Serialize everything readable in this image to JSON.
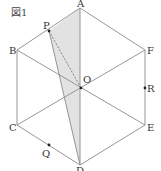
{
  "figure": {
    "title": "図1",
    "colors": {
      "line": "#8a8a8a",
      "shade": "#e2e2e2",
      "point": "#222222",
      "label": "#333333"
    },
    "vertices": {
      "A": {
        "label": "A",
        "x": 80,
        "y": 8
      },
      "B": {
        "label": "B",
        "x": 17,
        "y": 50
      },
      "C": {
        "label": "C",
        "x": 17,
        "y": 125
      },
      "D": {
        "label": "D",
        "x": 80,
        "y": 165
      },
      "E": {
        "label": "E",
        "x": 145,
        "y": 125
      },
      "F": {
        "label": "F",
        "x": 145,
        "y": 50
      },
      "O": {
        "label": "O",
        "x": 81,
        "y": 88
      }
    },
    "points": {
      "P": {
        "label": "P",
        "x": 49,
        "y": 31
      },
      "Q": {
        "label": "Q",
        "x": 49,
        "y": 145
      },
      "R": {
        "label": "R",
        "x": 145,
        "y": 88
      }
    },
    "shaded_triangle": [
      "A",
      "P",
      "D"
    ],
    "dashed_segment": [
      "P",
      "O"
    ]
  }
}
